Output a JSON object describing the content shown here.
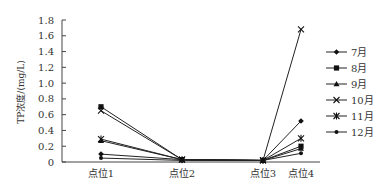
{
  "chart_data": {
    "type": "line",
    "title": "",
    "xlabel": "",
    "ylabel": "TP浓度/(mg/L)",
    "ylim": [
      0,
      1.8
    ],
    "yticks": [
      "0",
      "0.2",
      "0.4",
      "0.6",
      "0.8",
      "1.0",
      "1.2",
      "1.4",
      "1.6",
      "1.8"
    ],
    "categories": [
      "点位1",
      "点位2",
      "点位3",
      "点位4"
    ],
    "grid": false,
    "legend_position": "right",
    "series": [
      {
        "name": "7月",
        "marker": "diamond",
        "values": [
          0.1,
          0.03,
          0.02,
          0.52
        ]
      },
      {
        "name": "8月",
        "marker": "square",
        "values": [
          0.7,
          0.03,
          0.02,
          0.2
        ]
      },
      {
        "name": "9月",
        "marker": "triangle",
        "values": [
          0.27,
          0.03,
          0.02,
          0.17
        ]
      },
      {
        "name": "10月",
        "marker": "x",
        "values": [
          0.65,
          0.03,
          0.02,
          1.68
        ]
      },
      {
        "name": "11月",
        "marker": "star",
        "values": [
          0.29,
          0.03,
          0.02,
          0.3
        ]
      },
      {
        "name": "12月",
        "marker": "circle",
        "values": [
          0.05,
          0.02,
          0.02,
          0.11
        ]
      }
    ]
  }
}
